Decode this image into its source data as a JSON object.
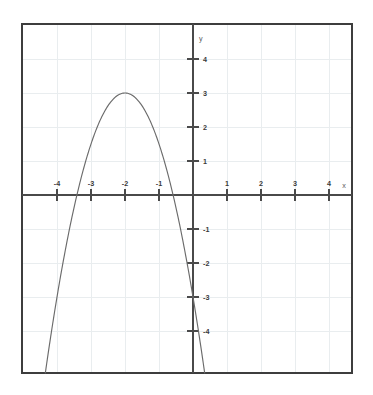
{
  "figure": {
    "kind": "cartesian-graph",
    "background_color": "#ffffff",
    "frame_color": "#3d3d3d",
    "grid_color": "#e8ecee",
    "axis_color": "#4a4a4a",
    "curve_color": "#6b6b6b"
  },
  "chart_data": {
    "type": "line",
    "title": "",
    "subtitle": "",
    "xlabel": "x",
    "ylabel": "y",
    "grid": true,
    "legend": null,
    "xlim": [
      -5.0,
      4.7
    ],
    "ylim": [
      -5.2,
      5.3
    ],
    "xticks": [
      -4,
      -3,
      -2,
      -1,
      1,
      2,
      3,
      4
    ],
    "yticks": [
      -4,
      -3,
      -2,
      -1,
      1,
      2,
      3,
      4
    ],
    "xtick_labels": [
      "-4",
      "-3",
      "-2",
      "-1",
      "1",
      "2",
      "3",
      "4"
    ],
    "ytick_labels": [
      "-4",
      "-3",
      "-2",
      "-1",
      "1",
      "2",
      "3",
      "4"
    ],
    "x_axis_label": "x",
    "y_axis_label": "y",
    "series": [
      {
        "name": "parabola",
        "equation": "y = -1.5(x + 2)^2 + 3",
        "shape": "downward-parabola",
        "vertex": [
          -2,
          3
        ],
        "a": -1.5,
        "roots": [
          -3.414,
          -0.586
        ],
        "y_intercept": -3,
        "x": [
          -3.85,
          -3.6,
          -3.4,
          -3.2,
          -3.0,
          -2.8,
          -2.6,
          -2.4,
          -2.2,
          -2.0,
          -1.8,
          -1.6,
          -1.4,
          -1.2,
          -1.0,
          -0.8,
          -0.6,
          -0.4,
          -0.2,
          0.0,
          -0.15
        ],
        "values": [
          -2.51,
          -0.84,
          0.06,
          0.84,
          1.5,
          2.04,
          2.46,
          2.76,
          2.94,
          3.0,
          2.94,
          2.76,
          2.46,
          2.04,
          1.5,
          0.84,
          0.06,
          -0.84,
          -1.86,
          -3.0,
          -2.43
        ]
      }
    ]
  },
  "labels": {
    "x_neg": [
      "-4",
      "-3",
      "-2",
      "-1"
    ],
    "x_pos": [
      "1",
      "2",
      "3",
      "4"
    ],
    "y_pos": [
      "1",
      "2",
      "3",
      "4"
    ],
    "y_neg": [
      "-1",
      "-2",
      "-3",
      "-4"
    ],
    "axis_x": "x",
    "axis_y": "y"
  }
}
